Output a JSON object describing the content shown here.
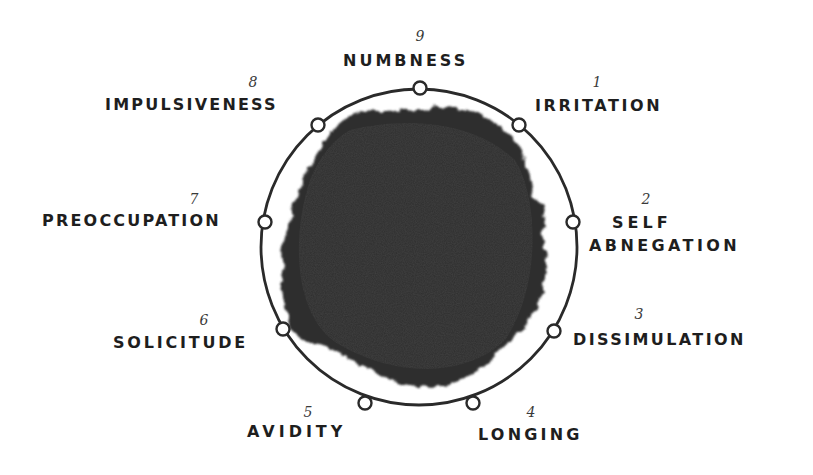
{
  "diagram": {
    "type": "circular-cycle",
    "ring": {
      "center": [
        419,
        247
      ],
      "radius": 158,
      "stroke": "#2a2a2a",
      "stroke_width": 2.8
    },
    "blob": {
      "fill": "#2e2e2e"
    },
    "states": [
      {
        "number": "1",
        "label": "IRRITATION",
        "node": [
          519,
          125
        ]
      },
      {
        "number": "2",
        "label": "SELF",
        "label2": "ABNEGATION",
        "node": [
          573,
          222
        ]
      },
      {
        "number": "3",
        "label": "DISSIMULATION",
        "node": [
          554,
          331
        ]
      },
      {
        "number": "4",
        "label": "LONGING",
        "node": [
          473,
          403
        ]
      },
      {
        "number": "5",
        "label": "AVIDITY",
        "node": [
          365,
          403
        ]
      },
      {
        "number": "6",
        "label": "SOLICITUDE",
        "node": [
          283,
          329
        ]
      },
      {
        "number": "7",
        "label": "PREOCCUPATION",
        "node": [
          265,
          222
        ]
      },
      {
        "number": "8",
        "label": "IMPULSIVENESS",
        "node": [
          318,
          125
        ]
      },
      {
        "number": "9",
        "label": "NUMBNESS",
        "node": [
          420,
          88
        ]
      }
    ]
  }
}
